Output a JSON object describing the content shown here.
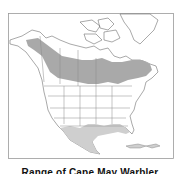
{
  "map": {
    "title": "Range map of North America",
    "caption": "Range of Cape May Warbler",
    "colors": {
      "background": "#ffffff",
      "frame": "#9a9a9a",
      "land_outline": "#6e6e6e",
      "borders": "#8a8a8a",
      "breeding_range": "#a9a9a9",
      "winter_range": "#cfcfcf"
    },
    "regions": [
      {
        "name": "breeding-range",
        "label": "Breeding range (boreal belt across Canada)"
      },
      {
        "name": "winter-range",
        "label": "Winter / migration range (Mexico, Gulf coast, Caribbean)"
      }
    ]
  }
}
